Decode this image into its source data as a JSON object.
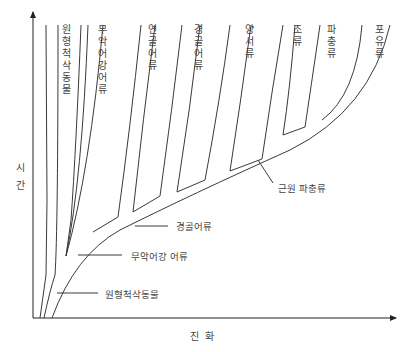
{
  "diagram": {
    "type": "evolutionary-tree",
    "axes": {
      "y_label": "시간",
      "x_label": "진화"
    },
    "branches": [
      {
        "label": "원형척삭동물"
      },
      {
        "label": "무악어강어류"
      },
      {
        "label": "연골어류"
      },
      {
        "label": "경골어류"
      },
      {
        "label": "양서류"
      },
      {
        "label": "조류"
      },
      {
        "label": "파충류"
      },
      {
        "label": "포유류"
      }
    ],
    "annotations": [
      {
        "label": "근원 파충류"
      },
      {
        "label": "경골어류"
      },
      {
        "label": "무악어강 어류"
      },
      {
        "label": "원형척삭동물"
      }
    ],
    "colors": {
      "line": "#3a3a3a",
      "background": "#ffffff"
    }
  }
}
